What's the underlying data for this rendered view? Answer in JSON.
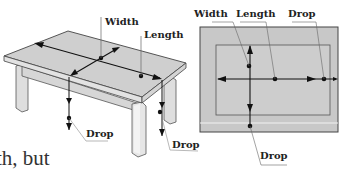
{
  "figure": {
    "left_diagram": {
      "subject": "table-perspective-view",
      "labels": {
        "width": "Width",
        "length": "Length",
        "drop_left": "Drop",
        "drop_right": "Drop"
      }
    },
    "right_diagram": {
      "subject": "table-top-plan-view",
      "labels": {
        "width": "Width",
        "length": "Length",
        "drop_top": "Drop",
        "drop_bottom": "Drop"
      }
    },
    "colors": {
      "table_top": "#cfcfcf",
      "table_edge": "#e2e2e2",
      "legs": "#dedede",
      "outline": "#444444",
      "arrows": "#111111",
      "leader_lines": "#666666",
      "plan_fill": "#c8c8c8",
      "plan_inner_fill": "#cdcdcd"
    }
  },
  "body_text": {
    "fragment": "th, but"
  }
}
